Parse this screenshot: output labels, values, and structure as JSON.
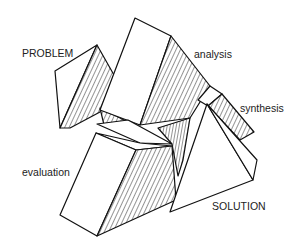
{
  "diagram": {
    "type": "design-process blocks",
    "stages": [
      {
        "id": "problem",
        "label": "PROBLEM"
      },
      {
        "id": "analysis",
        "label": "analysis"
      },
      {
        "id": "synthesis",
        "label": "synthesis"
      },
      {
        "id": "evaluation",
        "label": "evaluation"
      },
      {
        "id": "solution",
        "label": "SOLUTION"
      }
    ],
    "colors": {
      "line": "#111111",
      "face": "#ffffff",
      "text": "#222222"
    }
  }
}
